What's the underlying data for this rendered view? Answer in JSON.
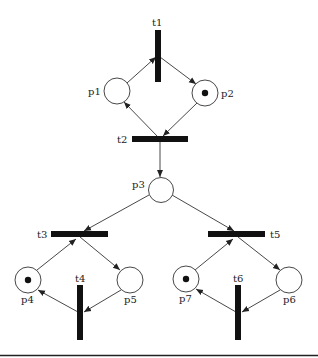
{
  "diagram": {
    "type": "petri-net",
    "places": [
      {
        "id": "p1",
        "label": "p1",
        "cx": 117,
        "cy": 91,
        "tokens": 0
      },
      {
        "id": "p2",
        "label": "p2",
        "cx": 205,
        "cy": 93,
        "tokens": 1
      },
      {
        "id": "p3",
        "label": "p3",
        "cx": 161,
        "cy": 190,
        "tokens": 0
      },
      {
        "id": "p4",
        "label": "p4",
        "cx": 28,
        "cy": 280,
        "tokens": 1
      },
      {
        "id": "p5",
        "label": "p5",
        "cx": 130,
        "cy": 280,
        "tokens": 0
      },
      {
        "id": "p6",
        "label": "p6",
        "cx": 289,
        "cy": 280,
        "tokens": 0
      },
      {
        "id": "p7",
        "label": "p7",
        "cx": 186,
        "cy": 279,
        "tokens": 1
      }
    ],
    "transitions": [
      {
        "id": "t1",
        "label": "t1",
        "orientation": "vertical"
      },
      {
        "id": "t2",
        "label": "t2",
        "orientation": "horizontal"
      },
      {
        "id": "t3",
        "label": "t3",
        "orientation": "horizontal"
      },
      {
        "id": "t4",
        "label": "t4",
        "orientation": "vertical"
      },
      {
        "id": "t5",
        "label": "t5",
        "orientation": "horizontal"
      },
      {
        "id": "t6",
        "label": "t6",
        "orientation": "vertical"
      }
    ],
    "arcs": [
      {
        "from": "p1",
        "to": "t1"
      },
      {
        "from": "t1",
        "to": "p2"
      },
      {
        "from": "p2",
        "to": "t2"
      },
      {
        "from": "t2",
        "to": "p1"
      },
      {
        "from": "t2",
        "to": "p3"
      },
      {
        "from": "p3",
        "to": "t3"
      },
      {
        "from": "p3",
        "to": "t5"
      },
      {
        "from": "p4",
        "to": "t3"
      },
      {
        "from": "t3",
        "to": "p5"
      },
      {
        "from": "p5",
        "to": "t4"
      },
      {
        "from": "t4",
        "to": "p4"
      },
      {
        "from": "p7",
        "to": "t5"
      },
      {
        "from": "t5",
        "to": "p6"
      },
      {
        "from": "p6",
        "to": "t6"
      },
      {
        "from": "t6",
        "to": "p7"
      }
    ]
  },
  "labels": {
    "t1": "t1",
    "t2": "t2",
    "t3": "t3",
    "t4": "t4",
    "t5": "t5",
    "t6": "t6",
    "p1": "p1",
    "p2": "p2",
    "p3": "p3",
    "p4": "p4",
    "p5": "p5",
    "p6": "p6",
    "p7": "p7"
  },
  "colors": {
    "stroke": "#333333",
    "bar": "#111111",
    "background": "#ffffff"
  }
}
